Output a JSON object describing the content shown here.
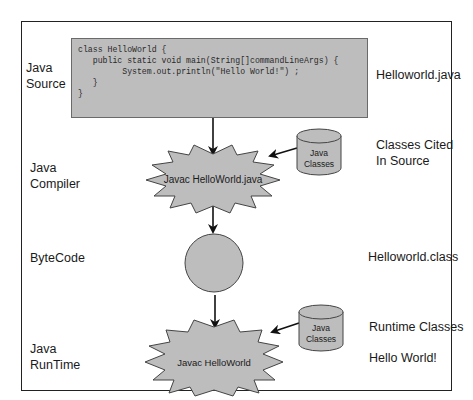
{
  "diagram": {
    "left_labels": {
      "java_source": [
        "Java",
        "Source"
      ],
      "java_compiler": [
        "Java",
        "Compiler"
      ],
      "bytecode": "ByteCode",
      "java_runtime": [
        "Java",
        "RunTime"
      ]
    },
    "right_labels": {
      "source_file": "Helloworld.java",
      "classes_cited": [
        "Classes Cited",
        "In Source"
      ],
      "class_file": "Helloworld.class",
      "runtime_classes": "Runtime Classes",
      "output": "Hello World!"
    },
    "code_lines": [
      "class HelloWorld {",
      "   public static void main(String[]commandLineArgs) {",
      "         System.out.println(\"Hello World!\") ;",
      "   }",
      "}"
    ],
    "compiler_node": "Javac HelloWorld.java",
    "runtime_node": "Javac HelloWorld",
    "library_compile": [
      "Java",
      "Classes"
    ],
    "library_runtime": [
      "Java",
      "Classes"
    ],
    "colors": {
      "shape_fill": "#bdbdbd",
      "stroke": "#222222",
      "background": "#ffffff"
    }
  }
}
